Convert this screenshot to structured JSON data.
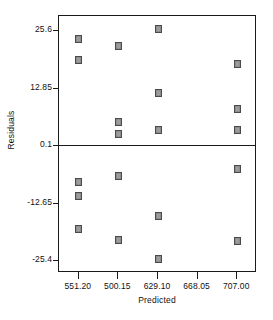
{
  "chart_data": {
    "type": "scatter",
    "title": "",
    "xlabel": "Predicted",
    "ylabel": "Residuals",
    "xtick_labels": [
      "551.20",
      "500.15",
      "629.10",
      "668.05",
      "707.00"
    ],
    "xtick_values": [
      551.2,
      500.15,
      629.1,
      668.05,
      707.0
    ],
    "ytick_labels": [
      "25.6",
      "12.85",
      "0.1",
      "-12.65",
      "-25.4"
    ],
    "ytick_values": [
      25.6,
      12.85,
      0.1,
      -12.65,
      -25.4
    ],
    "ylim": [
      -28.3,
      28.8
    ],
    "xlim": [
      0,
      5
    ],
    "grid": false,
    "legend": false,
    "reference_line": 0.1,
    "marker_shape": "square",
    "marker_color": "#9c9c9c",
    "marker_edge_color": "#4a4a4a",
    "axis_color": "#1a1a1a",
    "series": [
      {
        "name": "Residuals vs Predicted",
        "points": [
          {
            "x_category": "551.20",
            "x_index": 0,
            "y": 23.7
          },
          {
            "x_category": "551.20",
            "x_index": 0,
            "y": 19.1
          },
          {
            "x_category": "551.20",
            "x_index": 0,
            "y": -8.0
          },
          {
            "x_category": "551.20",
            "x_index": 0,
            "y": -11.1
          },
          {
            "x_category": "551.20",
            "x_index": 0,
            "y": -18.6
          },
          {
            "x_category": "500.15",
            "x_index": 1,
            "y": 22.1
          },
          {
            "x_category": "500.15",
            "x_index": 1,
            "y": 5.3
          },
          {
            "x_category": "500.15",
            "x_index": 1,
            "y": 2.6
          },
          {
            "x_category": "500.15",
            "x_index": 1,
            "y": -6.7
          },
          {
            "x_category": "500.15",
            "x_index": 1,
            "y": -21.0
          },
          {
            "x_category": "629.10",
            "x_index": 2,
            "y": 25.9
          },
          {
            "x_category": "629.10",
            "x_index": 2,
            "y": 11.8
          },
          {
            "x_category": "629.10",
            "x_index": 2,
            "y": 3.5
          },
          {
            "x_category": "629.10",
            "x_index": 2,
            "y": -15.6
          },
          {
            "x_category": "629.10",
            "x_index": 2,
            "y": -25.3
          },
          {
            "x_category": "707.00",
            "x_index": 4,
            "y": 18.1
          },
          {
            "x_category": "707.00",
            "x_index": 4,
            "y": 8.1
          },
          {
            "x_category": "707.00",
            "x_index": 4,
            "y": 3.5
          },
          {
            "x_category": "707.00",
            "x_index": 4,
            "y": -5.3
          },
          {
            "x_category": "707.00",
            "x_index": 4,
            "y": -21.1
          }
        ]
      }
    ]
  }
}
